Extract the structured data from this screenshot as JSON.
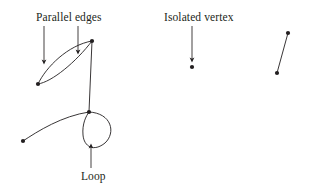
{
  "figure": {
    "type": "graph-diagram",
    "background_color": "#ffffff",
    "ink_color": "#231f20",
    "width": 314,
    "height": 194
  },
  "annotations": [
    {
      "id": "parallel-edges",
      "text": "Parallel edges",
      "x": 36,
      "y": 11,
      "arrows": [
        {
          "x1": 44,
          "y1": 26,
          "x2": 44,
          "y2": 62
        },
        {
          "x1": 78,
          "y1": 26,
          "x2": 78,
          "y2": 52
        }
      ]
    },
    {
      "id": "isolated-vertex",
      "text": "Isolated vertex",
      "x": 164,
      "y": 11,
      "arrows": [
        {
          "x1": 192,
          "y1": 26,
          "x2": 192,
          "y2": 60
        }
      ]
    },
    {
      "id": "loop",
      "text": "Loop",
      "x": 81,
      "y": 170,
      "arrows": [
        {
          "x1": 91,
          "y1": 168,
          "x2": 91,
          "y2": 146
        }
      ]
    }
  ],
  "vertices": [
    {
      "id": "v1",
      "label": "v",
      "sub": "1",
      "x": 23,
      "y": 141,
      "label_x": 14,
      "label_y": 143
    },
    {
      "id": "v2",
      "label": "v",
      "sub": "2",
      "x": 38,
      "y": 84,
      "label_x": 27,
      "label_y": 86
    },
    {
      "id": "v3",
      "label": "v",
      "sub": "3",
      "x": 92,
      "y": 41,
      "label_x": 96,
      "label_y": 31
    },
    {
      "id": "v4",
      "label": "v",
      "sub": "4",
      "x": 89,
      "y": 112,
      "label_x": 90,
      "label_y": 115
    },
    {
      "id": "v5",
      "label": "v",
      "sub": "5",
      "x": 192,
      "y": 67,
      "label_x": 198,
      "label_y": 62
    },
    {
      "id": "v6",
      "label": "v",
      "sub": "6",
      "x": 277,
      "y": 73,
      "label_x": 282,
      "label_y": 68
    },
    {
      "id": "v7",
      "label": "v",
      "sub": "7",
      "x": 288,
      "y": 33,
      "label_x": 293,
      "label_y": 28
    }
  ],
  "edges": [
    {
      "id": "e1",
      "label": "e",
      "sub": "1",
      "from": "v1",
      "to": "v4",
      "kind": "curve",
      "path": "M23,141 C 38,131 62,116 89,112",
      "label_x": 50,
      "label_y": 106
    },
    {
      "id": "e2",
      "label": "e",
      "sub": "2",
      "from": "v2",
      "to": "v3",
      "kind": "parallel-curve",
      "path": "M38,84 C 52,82 76,62 92,41",
      "label_x": 62,
      "label_y": 69
    },
    {
      "id": "e3",
      "label": "e",
      "sub": "3",
      "from": "v2",
      "to": "v3",
      "kind": "parallel-curve",
      "path": "M38,84 C 46,67 68,45 92,41",
      "label_x": 48,
      "label_y": 44
    },
    {
      "id": "e4",
      "label": "e",
      "sub": "4",
      "from": "v3",
      "to": "v4",
      "kind": "straight",
      "path": "M92,41 L89,112",
      "label_x": 92,
      "label_y": 71
    },
    {
      "id": "e5",
      "label": "e",
      "sub": "5",
      "from": "v4",
      "to": "v4",
      "kind": "loop",
      "path": "M89,112 C 112,113 116,133 105,143 C 94,152 84,147 83,135 C 82,124 86,116 89,112",
      "label_x": 105,
      "label_y": 138
    },
    {
      "id": "e6",
      "label": "e",
      "sub": "6",
      "from": "v6",
      "to": "v7",
      "kind": "straight",
      "path": "M277,73 L288,33",
      "label_x": 279,
      "label_y": 46
    }
  ]
}
